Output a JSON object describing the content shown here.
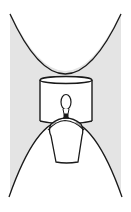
{
  "figure": {
    "colors": {
      "background": "#ffffff",
      "shadow_fill": "#e4e4e4",
      "line": "#1a1a1a"
    },
    "elements": {
      "upper_light_cone": "parabola-upward",
      "lower_light_cone": "parabola-downward",
      "lamp_shade": "cylinder",
      "bulb": "light-bulb",
      "lamp_base": "glass-jar"
    }
  }
}
